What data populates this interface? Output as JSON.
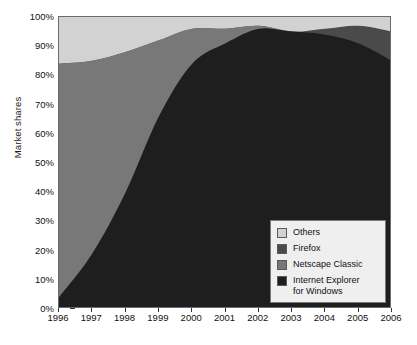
{
  "chart_data": {
    "type": "area",
    "title": "",
    "subtitle": "",
    "xlabel": "",
    "ylabel": "Market shares",
    "stacked": true,
    "grid": false,
    "legend_position": "bottom-right",
    "x": [
      1996,
      1997,
      1998,
      1999,
      2000,
      2001,
      2002,
      2003,
      2004,
      2005,
      2006
    ],
    "categories": [
      "1996",
      "1997",
      "1998",
      "1999",
      "2000",
      "2001",
      "2002",
      "2003",
      "2004",
      "2005",
      "2006"
    ],
    "xlim": [
      1996,
      2006
    ],
    "ylim": [
      0,
      100
    ],
    "yticks": [
      0,
      10,
      20,
      30,
      40,
      50,
      60,
      70,
      80,
      90,
      100
    ],
    "ytick_labels": [
      "0%",
      "10%",
      "20%",
      "30%",
      "40%",
      "50%",
      "60%",
      "70%",
      "80%",
      "90%",
      "100%"
    ],
    "series": [
      {
        "name": "Internet Explorer for Windows",
        "color": "#1e1e1e",
        "values": [
          4,
          19,
          40,
          66,
          84,
          91,
          96,
          95,
          94,
          91,
          85
        ]
      },
      {
        "name": "Netscape Classic",
        "color": "#787878",
        "values": [
          80,
          66,
          48,
          26,
          12,
          5,
          1,
          0,
          0,
          0,
          0
        ]
      },
      {
        "name": "Firefox",
        "color": "#4a4a4a",
        "values": [
          0,
          0,
          0,
          0,
          0,
          0,
          0,
          0,
          2,
          6,
          10
        ]
      },
      {
        "name": "Others",
        "color": "#d2d2d2",
        "values": [
          16,
          15,
          12,
          8,
          4,
          4,
          3,
          5,
          4,
          3,
          5
        ]
      }
    ],
    "series_order_bottom_to_top": [
      "Internet Explorer for Windows",
      "Netscape Classic",
      "Firefox",
      "Others"
    ],
    "cumulative_tops": {
      "ie": [
        4,
        19,
        40,
        66,
        84,
        91,
        96,
        95,
        94,
        91,
        85
      ],
      "ie_plus_netscape": [
        84,
        85,
        88,
        92,
        96,
        96,
        97,
        95,
        94,
        91,
        85
      ],
      "ie_plus_netscape_plus_firefox": [
        84,
        85,
        88,
        92,
        96,
        96,
        97,
        95,
        96,
        97,
        95
      ],
      "total": [
        100,
        100,
        100,
        100,
        100,
        100,
        100,
        100,
        100,
        100,
        100
      ]
    }
  },
  "axes": {
    "y_title": "Market shares",
    "y_tick_labels": [
      "100%",
      "90%",
      "80%",
      "70%",
      "60%",
      "50%",
      "40%",
      "30%",
      "20%",
      "10%",
      "0%"
    ],
    "x_tick_labels": [
      "1996",
      "1997",
      "1998",
      "1999",
      "2000",
      "2001",
      "2002",
      "2003",
      "2004",
      "2005",
      "2006"
    ]
  },
  "legend": {
    "items": [
      {
        "label": "Others",
        "color": "#d2d2d2"
      },
      {
        "label": "Firefox",
        "color": "#4a4a4a"
      },
      {
        "label": "Netscape Classic",
        "color": "#787878"
      },
      {
        "label": "Internet Explorer\nfor Windows",
        "color": "#1e1e1e"
      }
    ],
    "item_labels": {
      "others": "Others",
      "firefox": "Firefox",
      "netscape": "Netscape Classic",
      "ie_line1": "Internet Explorer",
      "ie_line2": "for Windows"
    },
    "background": "#efefef",
    "border": "#7a7a7a"
  },
  "colors": {
    "others": "#d2d2d2",
    "firefox": "#4a4a4a",
    "netscape": "#787878",
    "ie": "#1e1e1e",
    "axis": "#333333",
    "frame": "#6b6b6b",
    "background": "#ffffff"
  }
}
